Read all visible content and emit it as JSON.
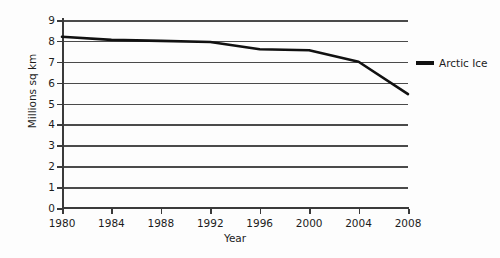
{
  "chart_data": {
    "type": "line",
    "title": "",
    "xlabel": "Year",
    "ylabel": "Millions sq km",
    "xlim": [
      1980,
      2008
    ],
    "ylim": [
      0,
      9
    ],
    "grid": "horizontal",
    "legend_position": "right",
    "x_ticks": [
      "1980",
      "1984",
      "1988",
      "1992",
      "1996",
      "2000",
      "2004",
      "2008"
    ],
    "y_ticks": [
      "0",
      "1",
      "2",
      "3",
      "4",
      "5",
      "6",
      "7",
      "8",
      "9"
    ],
    "series": [
      {
        "name": "Arctic Ice",
        "color": "#111111",
        "x": [
          1980,
          1984,
          1988,
          1992,
          1996,
          2000,
          2004,
          2008
        ],
        "values": [
          8.2,
          8.05,
          8.0,
          7.95,
          7.6,
          7.55,
          7.0,
          5.45
        ]
      }
    ]
  },
  "legend": {
    "entries": [
      {
        "label": "Arctic Ice",
        "color": "#111111",
        "marker": "line-swatch"
      }
    ]
  },
  "axes": {
    "y_title": "Millions sq km",
    "x_title": "Year"
  }
}
